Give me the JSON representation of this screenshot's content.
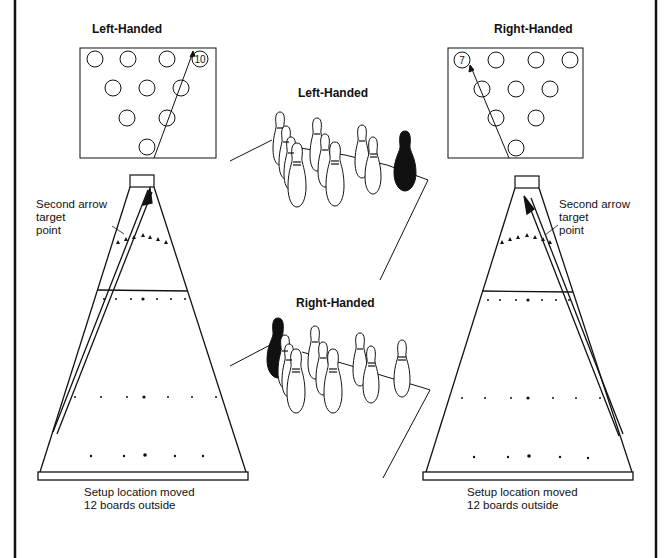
{
  "diagram": {
    "topic": "Bowling spare conversion: 10 pin (left-handed) and 7 pin (right-handed)",
    "left_panel": {
      "title": "Left-Handed",
      "target_pin": "10",
      "annotation_target": "Second arrow target point",
      "annotation_target_lines": [
        "Second arrow",
        "target",
        "point"
      ],
      "caption_lines": [
        "Setup location moved",
        "12 boards outside"
      ]
    },
    "right_panel": {
      "title": "Right-Handed",
      "target_pin": "7",
      "annotation_target_lines": [
        "Second arrow",
        "target",
        "point"
      ],
      "caption_lines": [
        "Setup location moved",
        "12 boards outside"
      ]
    },
    "center_top": {
      "title": "Left-Handed",
      "highlighted_pin": "10 pin (black)"
    },
    "center_bottom": {
      "title": "Right-Handed",
      "highlighted_pin": "7 pin (black)"
    },
    "colors": {
      "ink": "#111111",
      "paper": "#ffffff"
    }
  }
}
